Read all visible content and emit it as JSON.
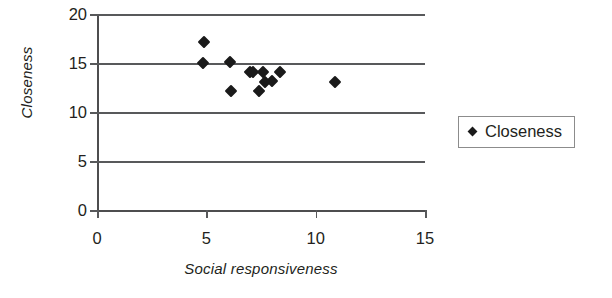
{
  "chart_data": {
    "type": "scatter",
    "title": "",
    "xlabel": "Social responsiveness",
    "ylabel": "Closeness",
    "xlim": [
      0,
      15
    ],
    "ylim": [
      0,
      20
    ],
    "xticks": [
      0,
      5,
      10,
      15
    ],
    "yticks": [
      0,
      5,
      10,
      15,
      20
    ],
    "grid": "horizontal",
    "legend_position": "right",
    "series": [
      {
        "name": "Closeness",
        "marker": "diamond",
        "color": "#1a1a1a",
        "points": [
          {
            "x": 4.9,
            "y": 17.1
          },
          {
            "x": 4.85,
            "y": 15.0
          },
          {
            "x": 6.1,
            "y": 15.1
          },
          {
            "x": 6.15,
            "y": 12.1
          },
          {
            "x": 7.0,
            "y": 14.1
          },
          {
            "x": 7.15,
            "y": 14.1
          },
          {
            "x": 7.4,
            "y": 12.1
          },
          {
            "x": 7.6,
            "y": 14.1
          },
          {
            "x": 7.7,
            "y": 13.1
          },
          {
            "x": 8.0,
            "y": 13.2
          },
          {
            "x": 8.35,
            "y": 14.1
          },
          {
            "x": 10.9,
            "y": 13.1
          }
        ]
      }
    ]
  },
  "legend": {
    "entries": [
      {
        "label": "Closeness"
      }
    ]
  },
  "axes": {
    "x_tick_labels": [
      "0",
      "5",
      "10",
      "15"
    ],
    "y_tick_labels": [
      "0",
      "5",
      "10",
      "15",
      "20"
    ]
  }
}
